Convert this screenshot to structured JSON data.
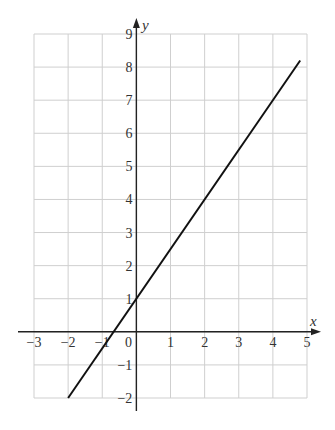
{
  "chart_data": {
    "type": "line",
    "title": "",
    "xlabel": "x",
    "ylabel": "y",
    "xlim": [
      -3,
      5
    ],
    "ylim": [
      -2,
      9
    ],
    "grid": true,
    "x_ticks": [
      -3,
      -2,
      -1,
      0,
      1,
      2,
      3,
      4,
      5
    ],
    "y_ticks": [
      -2,
      -1,
      1,
      2,
      3,
      4,
      5,
      6,
      7,
      8,
      9
    ],
    "x_tick_labels": [
      "−3",
      "−2",
      "−1",
      "0",
      "1",
      "2",
      "3",
      "4",
      "5"
    ],
    "y_tick_labels": [
      "−2",
      "−1",
      "1",
      "2",
      "3",
      "4",
      "5",
      "6",
      "7",
      "8",
      "9"
    ],
    "series": [
      {
        "name": "y = 1.5x + 1",
        "x": [
          -2,
          4.8
        ],
        "y": [
          -2,
          8.2
        ],
        "color": "#111111"
      }
    ]
  },
  "colors": {
    "grid": "#cfcfcf",
    "axis": "#222222",
    "line": "#111111"
  }
}
